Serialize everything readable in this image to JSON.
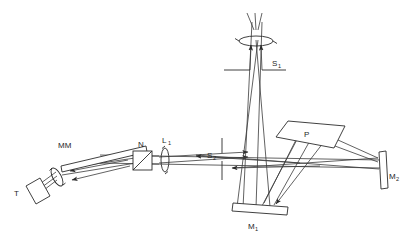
{
  "figure": {
    "kind": "optical-setup-diagram",
    "background_color": "#ffffff",
    "line_color": "#2b2b2b",
    "ray_color": "#3a3a3a",
    "width": 407,
    "height": 242
  },
  "labels": {
    "target": {
      "base": "T",
      "sub": ""
    },
    "multilayer_mirror": {
      "base": "MM",
      "sub": ""
    },
    "beam_splitter": {
      "base": "N",
      "sub": ""
    },
    "lens_one": {
      "base": "L",
      "sub": "1"
    },
    "slit_one": {
      "base": "S",
      "sub": "1"
    },
    "slit_two": {
      "base": "S",
      "sub": "2"
    },
    "prism": {
      "base": "P",
      "sub": ""
    },
    "mirror_one": {
      "base": "M",
      "sub": "1"
    },
    "mirror_two": {
      "base": "M",
      "sub": "2"
    }
  },
  "components": [
    {
      "id": "target-T",
      "name": "T",
      "type": "tilted-plate",
      "note": "target plate, lower left, tilted"
    },
    {
      "id": "collector-lens",
      "name": "",
      "type": "lens",
      "note": "small lens next to target T"
    },
    {
      "id": "multilayer-mirror",
      "name": "MM",
      "type": "tilted-slab-mirror",
      "note": "long tilted multilayer mirror, upper left"
    },
    {
      "id": "beamsplitter-N",
      "name": "N",
      "type": "square-beamsplitter",
      "note": "square box with diagonal splitting face"
    },
    {
      "id": "lens-L1",
      "name": "L1",
      "type": "lens",
      "note": "collimating lens after N"
    },
    {
      "id": "slit-S2",
      "name": "S2",
      "type": "slit",
      "note": "vertical slit on the horizontal axis"
    },
    {
      "id": "mirror-M1",
      "name": "M1",
      "type": "flat-mirror",
      "note": "horizontal flat mirror at the bottom"
    },
    {
      "id": "prism-P",
      "name": "P",
      "type": "prism",
      "note": "dispersing prism, quadrilateral, right of center"
    },
    {
      "id": "mirror-M2",
      "name": "M2",
      "type": "flat-mirror",
      "note": "vertical flat mirror at the far right"
    },
    {
      "id": "slit-S1",
      "name": "S1",
      "type": "slit",
      "note": "horizontal slit / aperture near the top"
    },
    {
      "id": "exit-lens",
      "name": "",
      "type": "lens",
      "note": "lens at the very top, beam exits upward"
    }
  ],
  "beam_path": [
    "T",
    "collector-lens",
    "MM",
    "N",
    "L1",
    "S2",
    "M1",
    "P",
    "M2",
    "M1",
    "S1",
    "exit-lens"
  ]
}
